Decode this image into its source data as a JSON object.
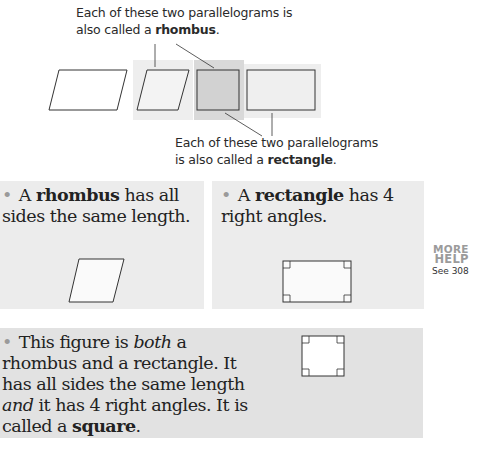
{
  "top_caption": {
    "line1": "Each of these two parallelograms is",
    "line2_prefix": "also called a ",
    "line2_bold": "rhombus",
    "line2_suffix": "."
  },
  "bottom_caption": {
    "line1": "Each of these two parallelograms",
    "line2_prefix": "is also called a ",
    "line2_bold": "rectangle",
    "line2_suffix": "."
  },
  "rhombus_box": {
    "prefix": "A ",
    "bold": "rhombus",
    "rest": " has all sides the same length."
  },
  "rectangle_box": {
    "prefix": "A ",
    "bold": "rectangle",
    "rest": " has 4 right angles."
  },
  "square_box": {
    "part1": "This figure is ",
    "italic1": "both",
    "part2": " a rhombus and a rectangle. It has all sides the same length ",
    "italic2": "and",
    "part3": " it has 4 right angles. It is called a ",
    "bold": "square",
    "part4": "."
  },
  "more_help": {
    "line1": "MORE",
    "line2": "HELP",
    "line3": "See 308"
  },
  "colors": {
    "box_bg": "#ececec",
    "square_box_bg": "#e2e2e2",
    "highlight_dark": "#d6d6d6",
    "highlight_light": "#eeeeee",
    "more_help_gray": "#9b9b9b"
  }
}
